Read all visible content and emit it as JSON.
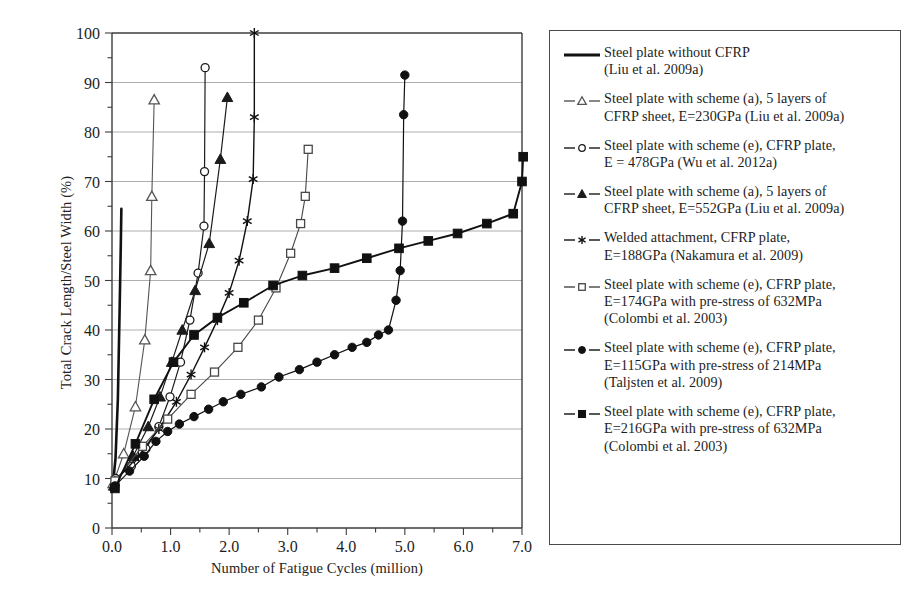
{
  "chart_data": {
    "type": "line",
    "title": "",
    "xlabel": "Number of Fatigue Cycles (million)",
    "ylabel": "Total Crack Length/Steel Width (%)",
    "xlim": [
      0.0,
      7.0
    ],
    "ylim": [
      0,
      100
    ],
    "xticks": [
      "0.0",
      "1.0",
      "2.0",
      "3.0",
      "4.0",
      "5.0",
      "6.0",
      "7.0"
    ],
    "xtick_values": [
      0.0,
      1.0,
      2.0,
      3.0,
      4.0,
      5.0,
      6.0,
      7.0
    ],
    "xminor_step": 0.5,
    "yticks": [
      "0",
      "10",
      "20",
      "30",
      "40",
      "50",
      "60",
      "70",
      "80",
      "90",
      "100"
    ],
    "ytick_values": [
      0,
      10,
      20,
      30,
      40,
      50,
      60,
      70,
      80,
      90,
      100
    ],
    "yminor_step": 5,
    "grid": "horizontal-major",
    "legend_position": "right-outside",
    "series": [
      {
        "name": "Steel plate without CFRP (Liu et al. 2009a)",
        "marker": "none",
        "line_width": 2.6,
        "color": "#111111",
        "x": [
          0.03,
          0.06,
          0.1,
          0.13,
          0.15,
          0.16
        ],
        "y": [
          10.5,
          14.0,
          26.0,
          44.0,
          57.0,
          64.5
        ]
      },
      {
        "name": "Steel plate with scheme (a), 5 layers of CFRP sheet, E=230GPa (Liu et al. 2009a)",
        "marker": "open-triangle",
        "line_width": 1.1,
        "color": "#555555",
        "x": [
          0.02,
          0.2,
          0.4,
          0.56,
          0.66,
          0.68,
          0.72
        ],
        "y": [
          9.0,
          15.0,
          24.5,
          38.0,
          52.0,
          67.0,
          86.5
        ]
      },
      {
        "name": "Steel plate with scheme (e), CFRP plate, E = 478GPa (Wu et al. 2012a)",
        "marker": "open-circle",
        "line_width": 1.2,
        "color": "#1b1b1b",
        "x": [
          0.06,
          0.33,
          0.58,
          0.8,
          0.99,
          1.17,
          1.33,
          1.47,
          1.57,
          1.58,
          1.59
        ],
        "y": [
          10.0,
          12.5,
          16.0,
          20.5,
          26.5,
          33.5,
          42.0,
          51.5,
          61.0,
          72.0,
          93.0
        ]
      },
      {
        "name": "Steel plate with scheme (a), 5 layers of CFRP sheet, E=552GPa (Liu et al. 2009a)",
        "marker": "filled-triangle",
        "line_width": 1.2,
        "color": "#1b1b1b",
        "x": [
          0.03,
          0.36,
          0.62,
          0.82,
          1.02,
          1.2,
          1.42,
          1.66,
          1.85,
          1.97
        ],
        "y": [
          8.5,
          14.5,
          20.5,
          26.5,
          33.5,
          40.0,
          48.0,
          57.5,
          74.5,
          87.0
        ]
      },
      {
        "name": "Welded attachment, CFRP plate, E=188GPa (Nakamura et al. 2009)",
        "marker": "asterisk",
        "line_width": 1.4,
        "color": "#111111",
        "x": [
          0.05,
          0.45,
          0.8,
          1.1,
          1.35,
          1.58,
          1.8,
          2.0,
          2.17,
          2.31,
          2.41,
          2.43,
          2.43
        ],
        "y": [
          9.5,
          14.5,
          20.0,
          25.5,
          31.0,
          36.5,
          42.0,
          47.5,
          54.0,
          62.0,
          70.5,
          83.0,
          100.0
        ]
      },
      {
        "name": "Steel plate with scheme (e), CFRP plate, E=174GPa with pre-stress of 632MPa (Colombi et al. 2003)",
        "marker": "open-square",
        "line_width": 1.1,
        "color": "#474747",
        "x": [
          0.05,
          0.52,
          0.95,
          1.35,
          1.75,
          2.15,
          2.5,
          2.8,
          3.05,
          3.22,
          3.3,
          3.35
        ],
        "y": [
          9.5,
          16.5,
          22.0,
          27.0,
          31.5,
          36.5,
          42.0,
          48.5,
          55.5,
          61.5,
          67.0,
          76.5
        ]
      },
      {
        "name": "Steel plate with scheme (e), CFRP plate, E=115GPa with pre-stress of 214MPa (Taljsten et al. 2009)",
        "marker": "filled-circle",
        "line_width": 1.2,
        "color": "#111111",
        "x": [
          0.05,
          0.3,
          0.55,
          0.75,
          0.95,
          1.15,
          1.4,
          1.65,
          1.9,
          2.2,
          2.55,
          2.85,
          3.2,
          3.5,
          3.8,
          4.1,
          4.35,
          4.55,
          4.72,
          4.85,
          4.92,
          4.96,
          4.98,
          5.0
        ],
        "y": [
          8.5,
          11.5,
          14.5,
          17.5,
          19.5,
          21.0,
          22.5,
          24.0,
          25.5,
          27.0,
          28.5,
          30.5,
          32.0,
          33.5,
          35.0,
          36.5,
          37.5,
          39.0,
          40.0,
          46.0,
          52.0,
          62.0,
          83.5,
          91.5
        ]
      },
      {
        "name": "Steel plate with scheme (e), CFRP plate, E=216GPa with pre-stress of 632MPa (Colombi et al. 2003)",
        "marker": "filled-square",
        "line_width": 1.9,
        "color": "#111111",
        "x": [
          0.05,
          0.4,
          0.72,
          1.05,
          1.4,
          1.8,
          2.25,
          2.75,
          3.25,
          3.8,
          4.35,
          4.9,
          5.4,
          5.9,
          6.4,
          6.85,
          7.0,
          7.02
        ],
        "y": [
          8.0,
          17.0,
          26.0,
          33.5,
          39.0,
          42.5,
          45.5,
          49.0,
          51.0,
          52.5,
          54.5,
          56.5,
          58.0,
          59.5,
          61.5,
          63.5,
          70.0,
          75.0
        ]
      }
    ]
  },
  "legend": {
    "entries": [
      {
        "marker": "none",
        "label": "Steel plate without CFRP\n(Liu et al. 2009a)"
      },
      {
        "marker": "open-triangle",
        "label": "Steel plate with scheme (a), 5 layers of\nCFRP sheet, E=230GPa (Liu et al. 2009a)"
      },
      {
        "marker": "open-circle",
        "label": "Steel plate with scheme (e), CFRP plate,\nE = 478GPa (Wu et al. 2012a)"
      },
      {
        "marker": "filled-triangle",
        "label": "Steel plate with scheme (a), 5 layers of\nCFRP sheet, E=552GPa (Liu et al. 2009a)"
      },
      {
        "marker": "asterisk",
        "label": "Welded attachment, CFRP plate,\nE=188GPa (Nakamura et al. 2009)"
      },
      {
        "marker": "open-square",
        "label": "Steel plate with scheme (e), CFRP plate,\nE=174GPa with pre-stress of 632MPa\n(Colombi et al. 2003)"
      },
      {
        "marker": "filled-circle",
        "label": "Steel plate with scheme (e), CFRP plate,\nE=115GPa with pre-stress of 214MPa\n(Taljsten et al. 2009)"
      },
      {
        "marker": "filled-square",
        "label": "Steel plate with scheme (e), CFRP plate,\nE=216GPa with pre-stress of 632MPa\n(Colombi et al. 2003)"
      }
    ]
  },
  "colors": {
    "axis": "#3d3d3d",
    "grid": "#9a9a9a",
    "text": "#1d1d1d",
    "plot_background": "#ffffff"
  }
}
